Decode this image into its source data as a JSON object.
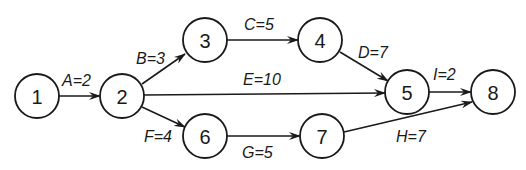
{
  "diagram": {
    "type": "activity-on-arrow network",
    "nodes": [
      {
        "id": "1",
        "label": "1",
        "x": 37,
        "y": 96
      },
      {
        "id": "2",
        "label": "2",
        "x": 122,
        "y": 96
      },
      {
        "id": "3",
        "label": "3",
        "x": 205,
        "y": 40
      },
      {
        "id": "4",
        "label": "4",
        "x": 320,
        "y": 40
      },
      {
        "id": "5",
        "label": "5",
        "x": 407,
        "y": 92
      },
      {
        "id": "6",
        "label": "6",
        "x": 205,
        "y": 136
      },
      {
        "id": "7",
        "label": "7",
        "x": 322,
        "y": 136
      },
      {
        "id": "8",
        "label": "8",
        "x": 493,
        "y": 92
      }
    ],
    "edges": [
      {
        "from": "1",
        "to": "2",
        "label": "A=2"
      },
      {
        "from": "2",
        "to": "3",
        "label": "B=3"
      },
      {
        "from": "3",
        "to": "4",
        "label": "C=5"
      },
      {
        "from": "4",
        "to": "5",
        "label": "D=7"
      },
      {
        "from": "2",
        "to": "5",
        "label": "E=10"
      },
      {
        "from": "2",
        "to": "6",
        "label": "F=4"
      },
      {
        "from": "6",
        "to": "7",
        "label": "G=5"
      },
      {
        "from": "7",
        "to": "8",
        "label": "H=7"
      },
      {
        "from": "5",
        "to": "8",
        "label": "I=2"
      }
    ]
  }
}
